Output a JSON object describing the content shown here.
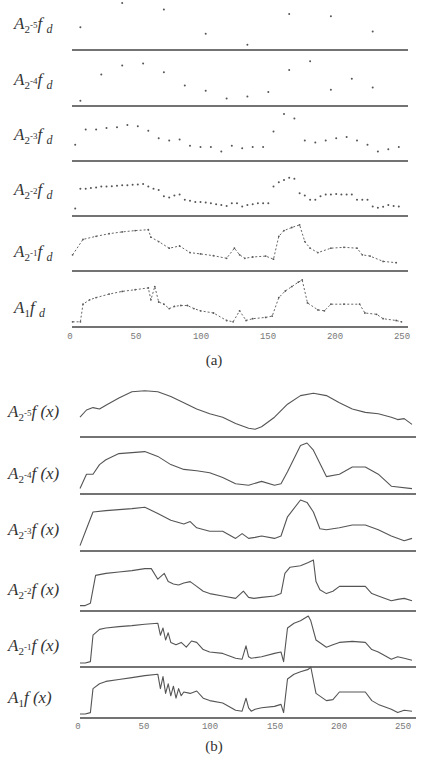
{
  "figure": {
    "panel_a": {
      "caption": "(a)",
      "labels": [
        {
          "base": "A",
          "sub": "2",
          "exp": "-5",
          "fn": "f",
          "arg": "d"
        },
        {
          "base": "A",
          "sub": "2",
          "exp": "-4",
          "fn": "f",
          "arg": "d"
        },
        {
          "base": "A",
          "sub": "2",
          "exp": "-3",
          "fn": "f",
          "arg": "d"
        },
        {
          "base": "A",
          "sub": "2",
          "exp": "-2",
          "fn": "f",
          "arg": "d"
        },
        {
          "base": "A",
          "sub": "2",
          "exp": "-1",
          "fn": "f",
          "arg": "d"
        },
        {
          "base": "A",
          "sub": "1",
          "exp": "",
          "fn": "f",
          "arg": "d"
        }
      ],
      "ticks": [
        "0",
        "50",
        "100",
        "150",
        "200",
        "250"
      ]
    },
    "panel_b": {
      "caption": "(b)",
      "labels": [
        {
          "base": "A",
          "sub": "2",
          "exp": "-5",
          "fn": "f",
          "arg": "(x)"
        },
        {
          "base": "A",
          "sub": "2",
          "exp": "-4",
          "fn": "f",
          "arg": "(x)"
        },
        {
          "base": "A",
          "sub": "2",
          "exp": "-3",
          "fn": "f",
          "arg": "(x)"
        },
        {
          "base": "A",
          "sub": "2",
          "exp": "-2",
          "fn": "f",
          "arg": "(x)"
        },
        {
          "base": "A",
          "sub": "2",
          "exp": "-1",
          "fn": "f",
          "arg": "(x)"
        },
        {
          "base": "A",
          "sub": "1",
          "exp": "",
          "fn": "f",
          "arg": "(x)"
        }
      ],
      "ticks": [
        "0",
        "50",
        "100",
        "150",
        "200",
        "250"
      ]
    }
  },
  "chart_data": [
    {
      "type": "scatter",
      "title": "(a) Discrete approximations at resolutions 2^-5 ... 1",
      "xlabel": "",
      "ylabel": "",
      "xlim": [
        0,
        256
      ],
      "xticks": [
        0,
        50,
        100,
        150,
        200,
        250
      ],
      "grid": false,
      "series": [
        {
          "name": "A_{2^-5} f_d",
          "x": [
            8,
            40,
            72,
            104,
            136,
            168,
            200,
            232
          ],
          "y": [
            0.45,
            1.0,
            0.85,
            0.3,
            0.05,
            0.75,
            0.7,
            0.35
          ]
        },
        {
          "name": "A_{2^-4} f_d",
          "x": [
            8,
            24,
            40,
            56,
            72,
            88,
            104,
            120,
            136,
            152,
            168,
            184,
            200,
            216,
            232
          ],
          "y": [
            0.05,
            0.65,
            0.85,
            0.9,
            0.7,
            0.4,
            0.28,
            0.1,
            0.15,
            0.25,
            0.75,
            0.95,
            0.3,
            0.55,
            0.35
          ]
        },
        {
          "name": "A_{2^-3} f_d",
          "x": [
            4,
            12,
            20,
            28,
            36,
            44,
            52,
            60,
            68,
            76,
            84,
            92,
            100,
            108,
            116,
            124,
            132,
            140,
            148,
            156,
            164,
            172,
            180,
            188,
            196,
            204,
            212,
            220,
            228,
            236,
            244,
            252
          ],
          "y": [
            0.3,
            0.65,
            0.65,
            0.68,
            0.7,
            0.75,
            0.72,
            0.62,
            0.45,
            0.4,
            0.42,
            0.28,
            0.25,
            0.25,
            0.15,
            0.28,
            0.22,
            0.25,
            0.25,
            0.6,
            1.0,
            0.9,
            0.4,
            0.35,
            0.4,
            0.45,
            0.48,
            0.4,
            0.3,
            0.15,
            0.2,
            0.25
          ]
        },
        {
          "name": "A_{2^-2} f_d",
          "x": [
            4,
            8,
            12,
            16,
            20,
            24,
            28,
            32,
            36,
            40,
            44,
            48,
            52,
            56,
            60,
            64,
            68,
            72,
            76,
            80,
            84,
            88,
            92,
            96,
            100,
            104,
            108,
            112,
            116,
            120,
            124,
            128,
            132,
            136,
            140,
            144,
            148,
            152,
            156,
            160,
            164,
            168,
            172,
            176,
            180,
            184,
            188,
            192,
            196,
            200,
            204,
            208,
            212,
            216,
            220,
            224,
            228,
            232,
            236,
            240,
            244,
            248,
            252
          ],
          "y": [
            0.1,
            0.55,
            0.55,
            0.57,
            0.58,
            0.6,
            0.6,
            0.61,
            0.62,
            0.63,
            0.63,
            0.64,
            0.65,
            0.66,
            0.6,
            0.55,
            0.52,
            0.38,
            0.35,
            0.4,
            0.42,
            0.3,
            0.28,
            0.25,
            0.25,
            0.24,
            0.22,
            0.2,
            0.18,
            0.16,
            0.22,
            0.22,
            0.15,
            0.18,
            0.2,
            0.22,
            0.22,
            0.22,
            0.6,
            0.7,
            0.75,
            0.8,
            0.78,
            0.45,
            0.4,
            0.3,
            0.3,
            0.38,
            0.42,
            0.42,
            0.43,
            0.42,
            0.42,
            0.42,
            0.3,
            0.3,
            0.3,
            0.15,
            0.12,
            0.14,
            0.18,
            0.16,
            0.15
          ]
        },
        {
          "name": "A_{2^-1} f_d",
          "x": [
            2,
            10,
            20,
            30,
            40,
            50,
            60,
            62,
            68,
            76,
            84,
            92,
            100,
            110,
            120,
            126,
            130,
            134,
            140,
            150,
            156,
            160,
            164,
            170,
            176,
            180,
            184,
            190,
            200,
            210,
            220,
            224,
            230,
            240,
            250
          ],
          "y": [
            0.3,
            0.65,
            0.72,
            0.78,
            0.82,
            0.85,
            0.87,
            0.7,
            0.6,
            0.45,
            0.5,
            0.35,
            0.32,
            0.28,
            0.22,
            0.45,
            0.3,
            0.22,
            0.25,
            0.27,
            0.2,
            0.72,
            0.85,
            0.92,
            0.98,
            0.6,
            0.45,
            0.35,
            0.45,
            0.47,
            0.45,
            0.3,
            0.27,
            0.15,
            0.12
          ]
        },
        {
          "name": "A_1 f_d",
          "x": [
            2,
            8,
            10,
            15,
            20,
            30,
            40,
            50,
            60,
            62,
            65,
            68,
            72,
            76,
            80,
            85,
            90,
            95,
            100,
            110,
            120,
            125,
            130,
            135,
            140,
            150,
            155,
            160,
            165,
            170,
            175,
            178,
            182,
            190,
            195,
            200,
            210,
            222,
            226,
            235,
            240,
            250,
            254
          ],
          "y": [
            0.05,
            0.05,
            0.45,
            0.55,
            0.6,
            0.68,
            0.74,
            0.78,
            0.82,
            0.55,
            0.85,
            0.5,
            0.45,
            0.35,
            0.4,
            0.42,
            0.42,
            0.35,
            0.3,
            0.25,
            0.08,
            0.05,
            0.3,
            0.08,
            0.12,
            0.15,
            0.18,
            0.6,
            0.75,
            0.85,
            0.95,
            1.0,
            0.48,
            0.32,
            0.3,
            0.45,
            0.45,
            0.45,
            0.25,
            0.22,
            0.12,
            0.08,
            0.05
          ]
        }
      ]
    },
    {
      "type": "line",
      "title": "(b) Continuous approximations at resolutions 2^-5 ... 1",
      "xlabel": "",
      "ylabel": "",
      "xlim": [
        0,
        256
      ],
      "xticks": [
        0,
        50,
        100,
        150,
        200,
        250
      ],
      "grid": false,
      "series": [
        {
          "name": "A_{2^-5} f(x)",
          "x": [
            0,
            5,
            10,
            15,
            20,
            30,
            40,
            50,
            60,
            70,
            80,
            90,
            100,
            110,
            120,
            130,
            135,
            140,
            150,
            160,
            170,
            180,
            190,
            200,
            210,
            220,
            230,
            240,
            245,
            250,
            256
          ],
          "y": [
            0.35,
            0.5,
            0.55,
            0.52,
            0.6,
            0.75,
            0.88,
            0.9,
            0.88,
            0.78,
            0.65,
            0.52,
            0.42,
            0.35,
            0.22,
            0.12,
            0.1,
            0.15,
            0.35,
            0.62,
            0.8,
            0.85,
            0.8,
            0.65,
            0.52,
            0.45,
            0.42,
            0.35,
            0.3,
            0.32,
            0.2
          ]
        },
        {
          "name": "A_{2^-4} f(x)",
          "x": [
            0,
            5,
            10,
            15,
            20,
            30,
            40,
            50,
            60,
            70,
            80,
            90,
            100,
            110,
            120,
            130,
            140,
            150,
            155,
            160,
            170,
            175,
            180,
            190,
            200,
            210,
            220,
            230,
            240,
            256
          ],
          "y": [
            0.05,
            0.35,
            0.35,
            0.55,
            0.65,
            0.78,
            0.8,
            0.82,
            0.72,
            0.55,
            0.45,
            0.42,
            0.38,
            0.28,
            0.15,
            0.12,
            0.2,
            0.12,
            0.15,
            0.4,
            0.95,
            1.0,
            0.85,
            0.3,
            0.35,
            0.5,
            0.5,
            0.35,
            0.1,
            0.05
          ]
        },
        {
          "name": "A_{2^-3} f(x)",
          "x": [
            0,
            5,
            10,
            20,
            30,
            40,
            50,
            60,
            70,
            80,
            85,
            90,
            100,
            110,
            120,
            125,
            130,
            135,
            140,
            150,
            155,
            160,
            170,
            175,
            180,
            185,
            190,
            200,
            210,
            220,
            230,
            240,
            250,
            256
          ],
          "y": [
            0.05,
            0.4,
            0.75,
            0.78,
            0.8,
            0.82,
            0.85,
            0.72,
            0.58,
            0.5,
            0.55,
            0.42,
            0.35,
            0.35,
            0.2,
            0.3,
            0.2,
            0.22,
            0.25,
            0.2,
            0.25,
            0.65,
            1.0,
            0.95,
            0.75,
            0.4,
            0.38,
            0.42,
            0.48,
            0.48,
            0.38,
            0.25,
            0.15,
            0.2
          ]
        },
        {
          "name": "A_{2^-2} f(x)",
          "x": [
            0,
            4,
            8,
            12,
            20,
            30,
            40,
            50,
            55,
            60,
            65,
            68,
            72,
            76,
            80,
            85,
            90,
            95,
            100,
            110,
            120,
            126,
            130,
            134,
            140,
            150,
            155,
            158,
            162,
            170,
            176,
            180,
            182,
            185,
            190,
            195,
            200,
            210,
            220,
            225,
            230,
            240,
            245,
            250,
            256
          ],
          "y": [
            0.05,
            0.05,
            0.1,
            0.68,
            0.72,
            0.75,
            0.78,
            0.82,
            0.82,
            0.6,
            0.72,
            0.55,
            0.5,
            0.48,
            0.52,
            0.55,
            0.45,
            0.35,
            0.3,
            0.25,
            0.2,
            0.35,
            0.22,
            0.2,
            0.22,
            0.25,
            0.3,
            0.72,
            0.85,
            0.88,
            0.95,
            1.0,
            0.55,
            0.38,
            0.3,
            0.35,
            0.45,
            0.45,
            0.45,
            0.3,
            0.25,
            0.15,
            0.18,
            0.2,
            0.15
          ]
        },
        {
          "name": "A_{2^-1} f(x)",
          "x": [
            0,
            4,
            8,
            10,
            15,
            20,
            30,
            40,
            50,
            60,
            62,
            64,
            66,
            68,
            70,
            74,
            78,
            82,
            86,
            90,
            95,
            100,
            110,
            120,
            125,
            128,
            130,
            132,
            140,
            150,
            155,
            157,
            160,
            165,
            170,
            176,
            178,
            182,
            190,
            195,
            200,
            210,
            220,
            225,
            230,
            240,
            245,
            250,
            256
          ],
          "y": [
            0.02,
            0.02,
            0.05,
            0.6,
            0.72,
            0.75,
            0.78,
            0.8,
            0.83,
            0.85,
            0.6,
            0.75,
            0.5,
            0.65,
            0.45,
            0.4,
            0.45,
            0.35,
            0.48,
            0.45,
            0.3,
            0.25,
            0.22,
            0.12,
            0.1,
            0.38,
            0.15,
            0.12,
            0.15,
            0.22,
            0.25,
            0.05,
            0.75,
            0.85,
            0.9,
            1.0,
            0.9,
            0.5,
            0.35,
            0.4,
            0.45,
            0.47,
            0.45,
            0.3,
            0.25,
            0.1,
            0.15,
            0.12,
            0.08
          ]
        },
        {
          "name": "A_1 f(x)",
          "x": [
            0,
            4,
            8,
            10,
            15,
            20,
            30,
            40,
            50,
            60,
            62,
            64,
            66,
            68,
            70,
            72,
            74,
            76,
            78,
            80,
            85,
            90,
            95,
            100,
            110,
            120,
            125,
            128,
            130,
            132,
            135,
            140,
            150,
            155,
            157,
            160,
            165,
            170,
            176,
            178,
            182,
            190,
            195,
            200,
            210,
            220,
            225,
            230,
            240,
            245,
            250,
            256
          ],
          "y": [
            0.02,
            0.02,
            0.05,
            0.55,
            0.65,
            0.7,
            0.74,
            0.78,
            0.82,
            0.85,
            0.55,
            0.8,
            0.45,
            0.65,
            0.4,
            0.6,
            0.35,
            0.55,
            0.4,
            0.48,
            0.45,
            0.5,
            0.35,
            0.3,
            0.25,
            0.1,
            0.08,
            0.35,
            0.15,
            0.08,
            0.12,
            0.15,
            0.18,
            0.22,
            0.05,
            0.75,
            0.85,
            0.9,
            0.95,
            1.0,
            0.45,
            0.3,
            0.32,
            0.48,
            0.48,
            0.48,
            0.3,
            0.22,
            0.12,
            0.05,
            0.1,
            0.08
          ]
        }
      ]
    }
  ]
}
